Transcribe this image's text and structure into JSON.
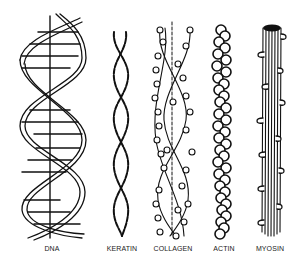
{
  "diagram": {
    "title": "",
    "structures": [
      {
        "id": "dna",
        "label": "DNA",
        "description": "double helix with base-pair rungs and central axis",
        "center_x": 52
      },
      {
        "id": "keratin",
        "label": "KERATIN",
        "description": "coiled-coil of two dashed strands",
        "center_x": 122
      },
      {
        "id": "collagen",
        "label": "COLLAGEN",
        "description": "triple helix of beaded strands with dashed strand",
        "center_x": 173
      },
      {
        "id": "actin",
        "label": "ACTIN",
        "description": "twisted double chain of globular subunits",
        "center_x": 224
      },
      {
        "id": "myosin",
        "label": "MYOSIN",
        "description": "bundle of filaments with projecting heads",
        "center_x": 270
      }
    ],
    "colors": {
      "ink": "#111111",
      "background": "#ffffff"
    }
  }
}
